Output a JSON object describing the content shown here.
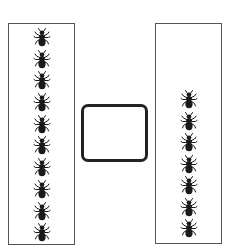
{
  "diagram": {
    "type": "comparison-worksheet",
    "left_group": {
      "label": "",
      "icon": "ant-icon",
      "count": 10,
      "top_offset": 4,
      "spacing": 21.7
    },
    "middle": {
      "type": "answer-box",
      "value": ""
    },
    "right_group": {
      "label": "",
      "icon": "ant-icon",
      "count": 7,
      "top_offset": 66,
      "spacing": 21.5
    },
    "colors": {
      "box_border": "#555555",
      "answer_box_border": "#222222",
      "ant": "#1a1a1a",
      "background": "#ffffff"
    }
  }
}
